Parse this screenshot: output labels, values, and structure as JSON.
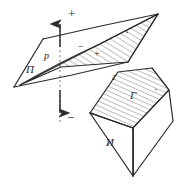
{
  "figure": {
    "kind": "geometry-line-drawing",
    "background_color": "#ffffff",
    "ink_color": "#2b2b2b",
    "hatch_color": "#555555",
    "labels": [
      {
        "id": "plane-pi",
        "text": "П",
        "x": 26,
        "y": 73,
        "size": 11,
        "style": "italic",
        "rotate": 0
      },
      {
        "id": "line-p",
        "text": "p",
        "x": 47,
        "y": 59,
        "size": 10,
        "style": "italic",
        "rotate": 0
      },
      {
        "id": "plus-top",
        "text": "+",
        "x": 70,
        "y": 16,
        "size": 12,
        "style": "normal",
        "rotate": 0
      },
      {
        "id": "minus-bottom",
        "text": "−",
        "x": 69,
        "y": 119,
        "size": 12,
        "style": "normal",
        "rotate": 0
      },
      {
        "id": "minus-plane",
        "text": "−",
        "x": 81,
        "y": 49,
        "size": 10,
        "style": "normal",
        "rotate": 0
      },
      {
        "id": "plus-plane",
        "text": "+",
        "x": 97,
        "y": 55,
        "size": 10,
        "style": "normal",
        "rotate": 0
      },
      {
        "id": "dot-plane",
        "text": "·",
        "x": 126,
        "y": 35,
        "size": 11,
        "style": "normal",
        "rotate": 0
      },
      {
        "id": "edge-g",
        "text": "г",
        "x": 115,
        "y": 78,
        "size": 10,
        "style": "italic",
        "rotate": 0
      },
      {
        "id": "body-gamma",
        "text": "Г",
        "x": 133,
        "y": 97,
        "size": 11,
        "style": "italic",
        "rotate": 0
      },
      {
        "id": "dot-body",
        "text": "·",
        "x": 155,
        "y": 92,
        "size": 10,
        "style": "normal",
        "rotate": 0
      },
      {
        "id": "body-i",
        "text": "И",
        "x": 110,
        "y": 143,
        "size": 11,
        "style": "italic",
        "rotate": 0
      }
    ],
    "shapes": {
      "plane_outline": "14,87 43,39 158,14 128,62",
      "half_plane_hatched": "20,85 158,14 128,62 61,67",
      "wedge_top_face": "90,113 118,72 152,68 169,90 133,128",
      "wedge_right_face": "169,90 173,120 133,176 133,128",
      "wedge_front_face": "90,113 133,128 133,176",
      "axis_line_x": 60,
      "axis_top_y": 20,
      "axis_bottom_y": 122
    },
    "arrows": {
      "up": {
        "x": 60,
        "y1": 48,
        "y2": 22,
        "head": "up"
      },
      "down": {
        "x": 60,
        "y1": 88,
        "y2": 114,
        "head": "down"
      }
    }
  }
}
